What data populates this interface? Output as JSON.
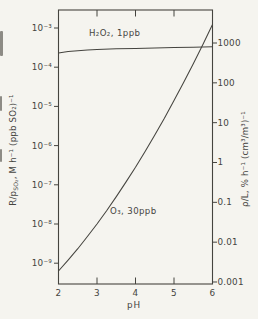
{
  "colors": {
    "paper": "#f5f4ef",
    "ink": "#45443f"
  },
  "chart_data": {
    "type": "line",
    "title": "",
    "xlabel": "pH",
    "xlim": [
      2,
      6
    ],
    "x_ticks": [
      2,
      3,
      4,
      5,
      6
    ],
    "x_inner_ticks": [
      3,
      4,
      5
    ],
    "grid": "off",
    "left_axis": {
      "scale": "log",
      "label_pre": "R/p",
      "label_sub": "SO₂",
      "label_post": ", M h⁻¹ (ppb SO₂)⁻¹",
      "tick_labels": [
        "10⁻³",
        "10⁻⁴",
        "10⁻⁵",
        "10⁻⁶",
        "10⁻⁷",
        "10⁻⁸",
        "10⁻⁹"
      ],
      "tick_log10_values": [
        -3,
        -4,
        -5,
        -6,
        -7,
        -8,
        -9
      ]
    },
    "right_axis": {
      "scale": "log",
      "label": "ρ/L, % h⁻¹ (cm³/m³)⁻¹",
      "tick_labels": [
        "1000",
        "100",
        "10",
        "1",
        "0.1",
        "0.01",
        "0.001"
      ]
    },
    "series": [
      {
        "name": "H2O2",
        "label": "H₂O₂, 1ppb",
        "x": [
          2,
          2.25,
          2.5,
          2.75,
          3,
          3.5,
          4,
          4.5,
          5,
          5.5,
          6
        ],
        "log10_y": [
          -3.64,
          -3.6,
          -3.58,
          -3.56,
          -3.55,
          -3.53,
          -3.52,
          -3.51,
          -3.5,
          -3.49,
          -3.48
        ]
      },
      {
        "name": "O3",
        "label": "O₃, 30ppb",
        "x": [
          2,
          2.25,
          2.5,
          2.75,
          3,
          3.25,
          3.5,
          3.75,
          4,
          4.25,
          4.5,
          4.75,
          5,
          5.25,
          5.5,
          5.75,
          6
        ],
        "log10_y": [
          -9.2,
          -8.92,
          -8.63,
          -8.32,
          -8.0,
          -7.66,
          -7.3,
          -6.93,
          -6.55,
          -6.15,
          -5.73,
          -5.3,
          -4.85,
          -4.39,
          -3.91,
          -3.42,
          -2.91
        ]
      }
    ]
  }
}
